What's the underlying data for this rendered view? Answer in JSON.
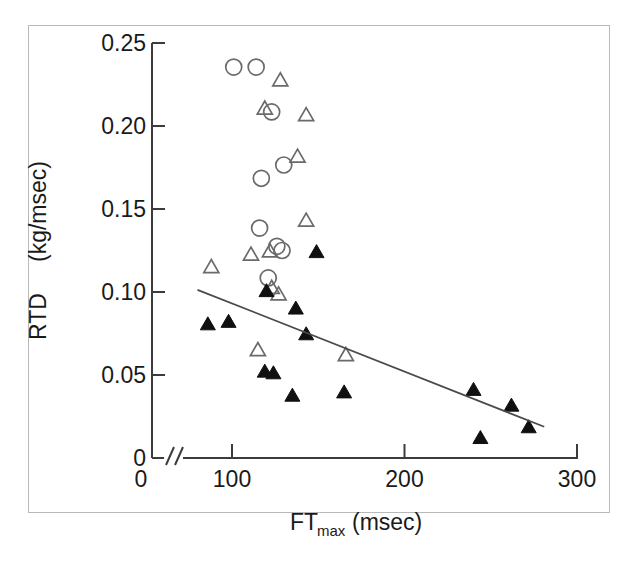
{
  "figure": {
    "border_color": "#b9b9b9",
    "background": "#ffffff"
  },
  "chart_data": {
    "type": "scatter",
    "title": "",
    "xlabel": "FTmax (msec)",
    "xlabel_main": "FT",
    "xlabel_sub": "max",
    "xlabel_unit": "(msec)",
    "ylabel": "RTD (kg/msec)",
    "ylabel_main": "RTD",
    "ylabel_unit": "(kg/msec)",
    "xlim": [
      0,
      300
    ],
    "ylim": [
      0,
      0.25
    ],
    "x_axis_break": true,
    "x_axis_break_symbol": "//",
    "xticks": [
      0,
      100,
      200,
      300
    ],
    "xtick_labels": [
      "0",
      "100",
      "200",
      "300"
    ],
    "yticks": [
      0,
      0.05,
      0.1,
      0.15,
      0.2,
      0.25
    ],
    "ytick_labels": [
      "0",
      "0.05",
      "0.10",
      "0.15",
      "0.20",
      "0.25"
    ],
    "grid": false,
    "legend_position": "none",
    "series": [
      {
        "name": "open-circle",
        "marker": "open_circle",
        "color": "#6a6a6a",
        "points": [
          [
            101,
            0.2355
          ],
          [
            114,
            0.2355
          ],
          [
            123,
            0.2085
          ],
          [
            130,
            0.1765
          ],
          [
            117,
            0.1685
          ],
          [
            116,
            0.1385
          ],
          [
            126,
            0.1275
          ],
          [
            129,
            0.125
          ],
          [
            121,
            0.1085
          ]
        ]
      },
      {
        "name": "open-triangle",
        "marker": "open_triangle",
        "color": "#6a6a6a",
        "points": [
          [
            128,
            0.2275
          ],
          [
            119,
            0.2105
          ],
          [
            143,
            0.2065
          ],
          [
            138,
            0.1815
          ],
          [
            143,
            0.143
          ],
          [
            88,
            0.115
          ],
          [
            111,
            0.1225
          ],
          [
            122,
            0.1245
          ],
          [
            123,
            0.1025
          ],
          [
            127,
            0.0985
          ],
          [
            115,
            0.065
          ],
          [
            166,
            0.062
          ]
        ]
      },
      {
        "name": "filled-triangle",
        "marker": "filled_triangle",
        "color": "#101010",
        "points": [
          [
            149,
            0.124
          ],
          [
            120,
            0.1005
          ],
          [
            137,
            0.09
          ],
          [
            86,
            0.0805
          ],
          [
            98,
            0.082
          ],
          [
            143,
            0.0745
          ],
          [
            119,
            0.052
          ],
          [
            124,
            0.051
          ],
          [
            135,
            0.0375
          ],
          [
            165,
            0.0395
          ],
          [
            240,
            0.041
          ],
          [
            262,
            0.0315
          ],
          [
            272,
            0.0185
          ],
          [
            244,
            0.012
          ]
        ]
      }
    ],
    "regression_line": {
      "name": "regression-line",
      "color": "#4a4a4a",
      "x_start": 80,
      "y_start": 0.1013,
      "x_end": 281,
      "y_end": 0.0188
    }
  }
}
